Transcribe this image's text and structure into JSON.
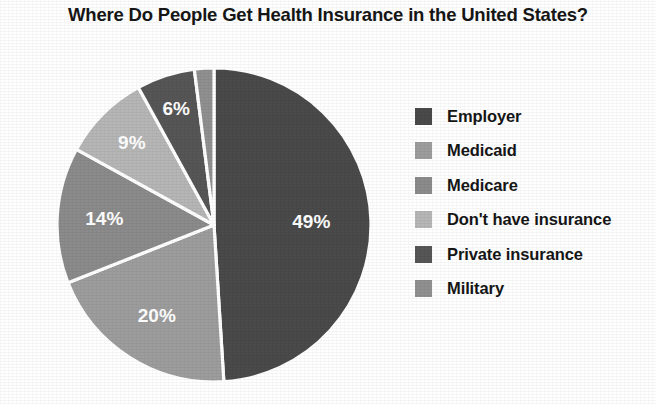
{
  "chart_data": {
    "type": "pie",
    "title": "Where Do People Get Health Insurance in the United States?",
    "xlabel": "",
    "ylabel": "",
    "legend_position": "right",
    "grid": false,
    "value_suffix": "%",
    "categories": [
      "Employer",
      "Medicaid",
      "Medicare",
      "Don't have insurance",
      "Private insurance",
      "Military"
    ],
    "values": [
      49,
      20,
      14,
      9,
      6,
      2
    ],
    "labels": [
      "49%",
      "20%",
      "14%",
      "9%",
      "6%",
      "2%"
    ],
    "colors": [
      "#4a4a4a",
      "#9d9d9d",
      "#8b8b8b",
      "#b6b6b6",
      "#565656",
      "#909090"
    ],
    "slices": [
      {
        "name": "Employer",
        "value": 49,
        "label": "49%",
        "color": "#4a4a4a"
      },
      {
        "name": "Medicaid",
        "value": 20,
        "label": "20%",
        "color": "#9d9d9d"
      },
      {
        "name": "Medicare",
        "value": 14,
        "label": "14%",
        "color": "#8b8b8b"
      },
      {
        "name": "Don't have insurance",
        "value": 9,
        "label": "9%",
        "color": "#b6b6b6"
      },
      {
        "name": "Private insurance",
        "value": 6,
        "label": "6%",
        "color": "#565656"
      },
      {
        "name": "Military",
        "value": 2,
        "label": "2%",
        "color": "#909090"
      }
    ]
  },
  "legend": {
    "items": [
      {
        "label": "Employer",
        "color": "#4a4a4a"
      },
      {
        "label": "Medicaid",
        "color": "#9d9d9d"
      },
      {
        "label": "Medicare",
        "color": "#8b8b8b"
      },
      {
        "label": "Don't have insurance",
        "color": "#b6b6b6"
      },
      {
        "label": "Private insurance",
        "color": "#565656"
      },
      {
        "label": "Military",
        "color": "#909090"
      }
    ]
  }
}
